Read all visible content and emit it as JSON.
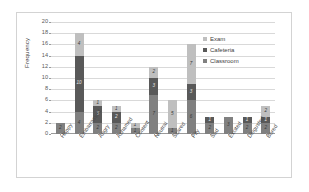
{
  "chart_data": {
    "type": "bar",
    "subtype": "stacked-bar",
    "title": "",
    "xlabel": "",
    "ylabel": "Frequency",
    "ylim": [
      0,
      20
    ],
    "ytick_step": 2,
    "ytick_labels": [
      "20",
      "18",
      "16",
      "14",
      "12",
      "10",
      "8",
      "6",
      "4",
      "2",
      "0"
    ],
    "grid": true,
    "legend_position": "inside-top-right",
    "categories": [
      "Happy",
      "Embarrassed",
      "Angry",
      "Ashamed",
      "Content",
      "Neutral",
      "Scared",
      "Pity",
      "Sad",
      "Excited",
      "Disgusted",
      "Bored"
    ],
    "series": [
      {
        "name": "Classroom",
        "color": "#808080",
        "values": [
          2,
          4,
          2,
          2,
          1,
          7,
          1,
          6,
          2,
          3,
          2,
          2
        ],
        "labels": [
          "2",
          "4",
          "2",
          "2",
          "1",
          "7",
          "1",
          "6",
          "2",
          "3",
          "2",
          "2"
        ]
      },
      {
        "name": "Cafeteria",
        "color": "#595959",
        "values": [
          0,
          10,
          3,
          2,
          0,
          3,
          0,
          3,
          1,
          0,
          1,
          1
        ],
        "labels": [
          "",
          "10",
          "3",
          "2",
          "",
          "3",
          "",
          "3",
          "1",
          "",
          "1",
          "1"
        ]
      },
      {
        "name": "Exam",
        "color": "#bfbfbf",
        "values": [
          0,
          4,
          1,
          1,
          1,
          2,
          5,
          7,
          0,
          0,
          0,
          2
        ],
        "labels": [
          "",
          "4",
          "1",
          "1",
          "1",
          "2",
          "5",
          "7",
          "",
          "",
          "",
          "2"
        ]
      }
    ],
    "totals": [
      2,
      18,
      6,
      5,
      2,
      12,
      6,
      16,
      3,
      3,
      3,
      5
    ]
  },
  "legend": {
    "entries": [
      {
        "label": "Exam",
        "color": "#bfbfbf"
      },
      {
        "label": "Cafeteria",
        "color": "#595959"
      },
      {
        "label": "Classroom",
        "color": "#808080"
      }
    ]
  },
  "axis": {
    "y_title": "Frequency"
  }
}
